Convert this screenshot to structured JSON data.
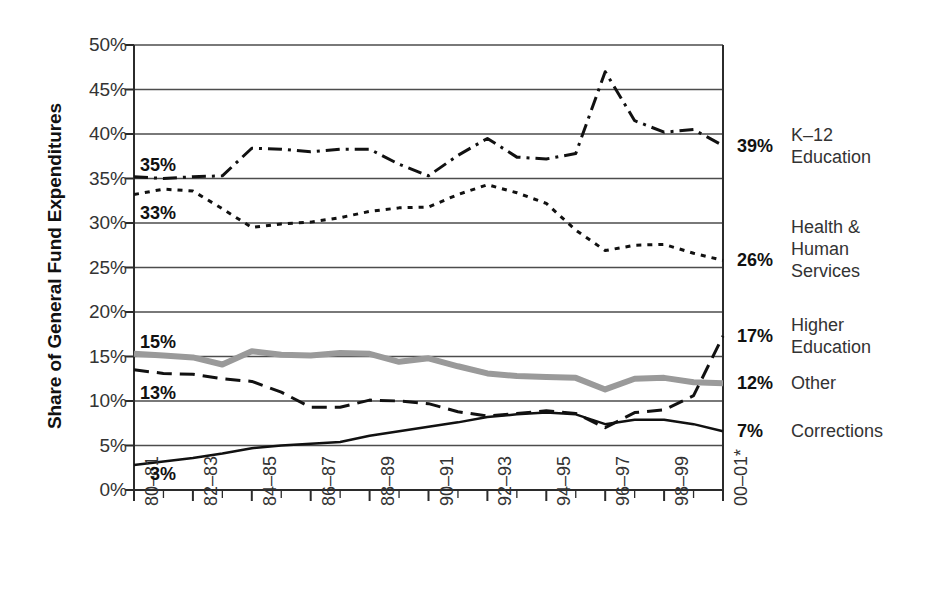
{
  "chart_data": {
    "type": "line",
    "title": "",
    "xlabel": "",
    "ylabel": "Share of General Fund Expenditures",
    "ylim": [
      0,
      50
    ],
    "yticks": [
      "0%",
      "5%",
      "10%",
      "15%",
      "20%",
      "25%",
      "30%",
      "35%",
      "40%",
      "45%",
      "50%"
    ],
    "ytick_values": [
      0,
      5,
      10,
      15,
      20,
      25,
      30,
      35,
      40,
      45,
      50
    ],
    "grid": true,
    "legend_position": "right-of-plot",
    "x": [
      "80-81",
      "81-82",
      "82-83",
      "83-84",
      "84-85",
      "85-86",
      "86-87",
      "87-88",
      "88-89",
      "89-90",
      "90-91",
      "91-92",
      "92-93",
      "93-94",
      "94-95",
      "95-96",
      "96-97",
      "97-98",
      "98-99",
      "99-00",
      "00-01*"
    ],
    "xtick_labels": [
      "80–81",
      "82–83",
      "84–85",
      "86–87",
      "88–89",
      "90–91",
      "92–93",
      "94–95",
      "96–97",
      "98–99",
      "00–01*"
    ],
    "xtick_indices": [
      0,
      2,
      4,
      6,
      8,
      10,
      12,
      14,
      16,
      18,
      20
    ],
    "series": [
      {
        "name": "K-12 Education",
        "label_lines": [
          "K–12",
          "Education"
        ],
        "style": "dash-dot",
        "color": "#111111",
        "width": 3,
        "start_label": "35%",
        "end_label": "39%",
        "values": [
          35.2,
          35.0,
          35.2,
          35.3,
          38.4,
          38.3,
          38.0,
          38.3,
          38.3,
          36.6,
          35.3,
          37.6,
          39.5,
          37.4,
          37.2,
          37.8,
          47.0,
          41.5,
          40.2,
          40.5,
          38.7
        ]
      },
      {
        "name": "Health & Human Services",
        "label_lines": [
          "Health &",
          "Human",
          "Services"
        ],
        "style": "dotted",
        "color": "#111111",
        "width": 3,
        "start_label": "33%",
        "end_label": "26%",
        "values": [
          33.2,
          33.8,
          33.6,
          31.6,
          29.5,
          29.9,
          30.1,
          30.6,
          31.3,
          31.7,
          31.8,
          33.2,
          34.3,
          33.4,
          32.2,
          29.2,
          26.9,
          27.5,
          27.6,
          26.6,
          25.8
        ]
      },
      {
        "name": "Higher Education",
        "label_lines": [
          "Higher",
          "Education"
        ],
        "style": "dashed",
        "color": "#111111",
        "width": 3,
        "start_label": "13%",
        "end_label": "17%",
        "values": [
          13.5,
          13.1,
          13.0,
          12.5,
          12.2,
          11.0,
          9.3,
          9.3,
          10.1,
          10.0,
          9.7,
          8.8,
          8.3,
          8.6,
          8.9,
          8.6,
          7.0,
          8.7,
          9.0,
          10.6,
          17.3
        ]
      },
      {
        "name": "Other",
        "label_lines": [
          "Other"
        ],
        "style": "solid-thick-gray",
        "color": "#9a9a9a",
        "width": 6,
        "start_label": "15%",
        "end_label": "12%",
        "values": [
          15.3,
          15.1,
          14.9,
          14.1,
          15.6,
          15.2,
          15.1,
          15.4,
          15.3,
          14.4,
          14.8,
          13.9,
          13.1,
          12.8,
          12.7,
          12.6,
          11.3,
          12.5,
          12.6,
          12.1,
          12.0
        ]
      },
      {
        "name": "Corrections",
        "label_lines": [
          "Corrections"
        ],
        "style": "solid",
        "color": "#111111",
        "width": 2.5,
        "start_label": "3%",
        "end_label": "7%",
        "values": [
          2.8,
          3.2,
          3.6,
          4.1,
          4.7,
          5.0,
          5.2,
          5.4,
          6.1,
          6.6,
          7.1,
          7.6,
          8.2,
          8.5,
          8.7,
          8.5,
          7.4,
          7.9,
          7.9,
          7.4,
          6.6
        ]
      }
    ],
    "start_labels": [
      {
        "text": "35%",
        "series": "K-12 Education"
      },
      {
        "text": "33%",
        "series": "Health & Human Services"
      },
      {
        "text": "15%",
        "series": "Other"
      },
      {
        "text": "13%",
        "series": "Higher Education"
      },
      {
        "text": "3%",
        "series": "Corrections"
      }
    ]
  }
}
